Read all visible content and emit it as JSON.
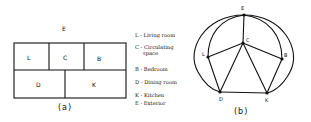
{
  "panel_a": {
    "exterior_label": "E",
    "rooms": [
      {
        "label": "L"
      },
      {
        "label": "C"
      },
      {
        "label": "B"
      },
      {
        "label": "D"
      },
      {
        "label": "K"
      }
    ],
    "caption": "(a)"
  },
  "legend": {
    "items": [
      {
        "text": "L - Living room"
      },
      {
        "text": "C - Circulating"
      },
      {
        "text": "space"
      },
      {
        "text": "B - Bedroom"
      },
      {
        "text": "D - Dining room"
      },
      {
        "text": "K - Kitchen"
      },
      {
        "text": "E - Exterior"
      }
    ]
  },
  "panel_b": {
    "nodes": [
      {
        "id": "E"
      },
      {
        "id": "C"
      },
      {
        "id": "L"
      },
      {
        "id": "B"
      },
      {
        "id": "D"
      },
      {
        "id": "K"
      }
    ],
    "caption": "(b)"
  }
}
